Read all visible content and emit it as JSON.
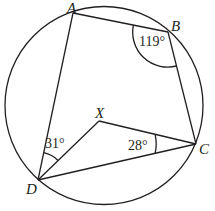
{
  "diagram": {
    "type": "cyclic-quadrilateral",
    "circle": {
      "cx": 104,
      "cy": 105.5,
      "r": 99
    },
    "points": {
      "A": {
        "label": "A",
        "x": 73,
        "y": 13
      },
      "B": {
        "label": "B",
        "x": 168,
        "y": 32
      },
      "C": {
        "label": "C",
        "x": 196,
        "y": 144
      },
      "D": {
        "label": "D",
        "x": 38,
        "y": 180
      },
      "X": {
        "label": "X",
        "x": 99,
        "y": 121
      }
    },
    "segments": [
      "AB",
      "BC",
      "CD",
      "DA",
      "DX",
      "XC"
    ],
    "angles": {
      "ABC": {
        "label": "119°",
        "vertex": "B"
      },
      "ADX": {
        "label": "31°",
        "vertex": "D"
      },
      "XCD": {
        "label": "28°",
        "vertex": "C"
      }
    },
    "colors": {
      "stroke": "#231f20",
      "background": "#ffffff"
    }
  }
}
